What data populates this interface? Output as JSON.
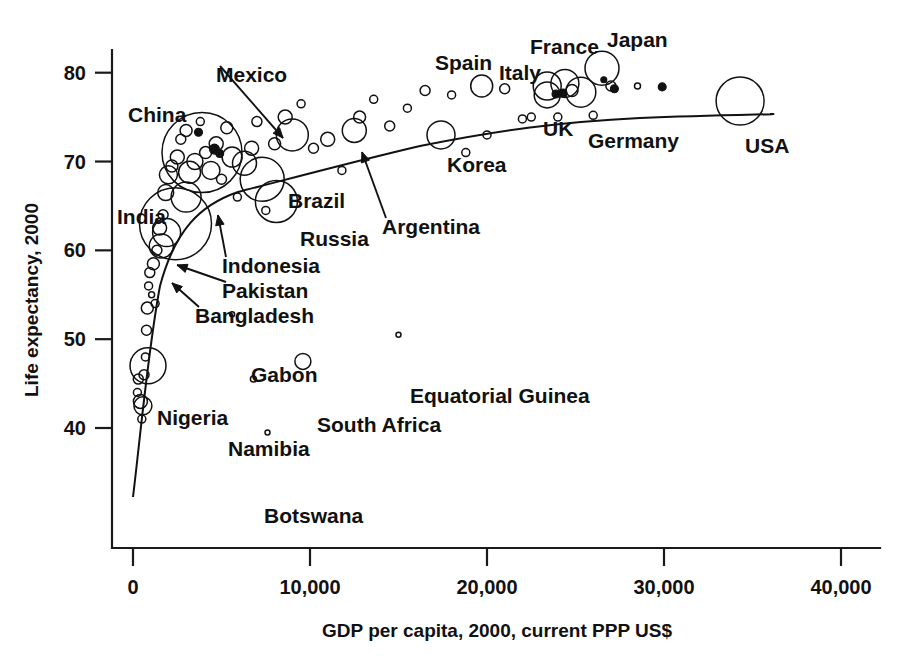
{
  "chart_data": {
    "type": "scatter",
    "title": "",
    "xlabel": "GDP per capita, 2000, current PPP US$",
    "ylabel": "Life expectancy, 2000",
    "xlim": [
      0,
      40000
    ],
    "ylim": [
      37,
      82
    ],
    "xticks": [
      0,
      10000,
      20000,
      30000,
      40000
    ],
    "xtick_labels": [
      "0",
      "10,000",
      "20,000",
      "30,000",
      "40,000"
    ],
    "yticks": [
      40,
      50,
      60,
      70,
      80
    ],
    "ytick_labels": [
      "40",
      "50",
      "60",
      "70",
      "80"
    ],
    "grid": false,
    "legend": "none",
    "marker_note": "bubble size proportional to population",
    "trend_line": true,
    "labeled_points": [
      {
        "name": "China",
        "x": 3900,
        "y": 71.0,
        "r": 40,
        "label_x": 128,
        "label_y": 122,
        "anchor": "start",
        "leader": false
      },
      {
        "name": "India",
        "x": 2400,
        "y": 63.0,
        "r": 36,
        "label_x": 117,
        "label_y": 224,
        "anchor": "start",
        "leader": false
      },
      {
        "name": "Indonesia",
        "x": 3000,
        "y": 66.0,
        "r": 15,
        "label_x": 222,
        "label_y": 273,
        "anchor": "start",
        "leader": true,
        "tip_x": 218,
        "tip_y": 215
      },
      {
        "name": "Pakistan",
        "x": 1900,
        "y": 62.0,
        "r": 14,
        "label_x": 222,
        "label_y": 298,
        "anchor": "start",
        "leader": true,
        "tip_x": 177,
        "tip_y": 265
      },
      {
        "name": "Bangladesh",
        "x": 1600,
        "y": 60.5,
        "r": 12,
        "label_x": 195,
        "label_y": 323,
        "anchor": "start",
        "leader": true,
        "tip_x": 172,
        "tip_y": 283
      },
      {
        "name": "Mexico",
        "x": 9000,
        "y": 73.0,
        "r": 16,
        "label_x": 216,
        "label_y": 82,
        "anchor": "start",
        "leader": true,
        "tip_x": 283,
        "tip_y": 138
      },
      {
        "name": "Brazil",
        "x": 7300,
        "y": 68.0,
        "r": 22,
        "label_x": 288,
        "label_y": 208,
        "anchor": "start",
        "leader": false
      },
      {
        "name": "Russia",
        "x": 8100,
        "y": 65.5,
        "r": 21,
        "label_x": 300,
        "label_y": 246,
        "anchor": "start",
        "leader": false
      },
      {
        "name": "Argentina",
        "x": 12500,
        "y": 73.5,
        "r": 12,
        "label_x": 382,
        "label_y": 234,
        "anchor": "start",
        "leader": true,
        "tip_x": 362,
        "tip_y": 152
      },
      {
        "name": "Korea",
        "x": 17400,
        "y": 73.0,
        "r": 14,
        "label_x": 447,
        "label_y": 172,
        "anchor": "start",
        "leader": false
      },
      {
        "name": "Spain",
        "x": 19700,
        "y": 78.5,
        "r": 11,
        "label_x": 435,
        "label_y": 70,
        "anchor": "start",
        "leader": false
      },
      {
        "name": "Italy",
        "x": 23400,
        "y": 78.5,
        "r": 14,
        "label_x": 499,
        "label_y": 80,
        "anchor": "start",
        "leader": false
      },
      {
        "name": "France",
        "x": 24400,
        "y": 78.8,
        "r": 14,
        "label_x": 530,
        "label_y": 54,
        "anchor": "start",
        "leader": false
      },
      {
        "name": "Japan",
        "x": 26500,
        "y": 80.5,
        "r": 17,
        "label_x": 607,
        "label_y": 47,
        "anchor": "start",
        "leader": false
      },
      {
        "name": "UK",
        "x": 23400,
        "y": 77.5,
        "r": 13,
        "label_x": 543,
        "label_y": 136,
        "anchor": "start",
        "leader": false
      },
      {
        "name": "Germany",
        "x": 25300,
        "y": 77.8,
        "r": 15,
        "label_x": 588,
        "label_y": 148,
        "anchor": "start",
        "leader": false
      },
      {
        "name": "USA",
        "x": 34300,
        "y": 76.8,
        "r": 24,
        "label_x": 745,
        "label_y": 153,
        "anchor": "start",
        "leader": false
      },
      {
        "name": "Gabon",
        "x": 5600,
        "y": 52.8,
        "r": 2.5,
        "label_x": 251,
        "label_y": 382,
        "anchor": "start",
        "leader": false
      },
      {
        "name": "Equatorial Guinea",
        "x": 15000,
        "y": 50.5,
        "r": 2.5,
        "label_x": 410,
        "label_y": 403,
        "anchor": "start",
        "leader": false
      },
      {
        "name": "South Africa",
        "x": 9600,
        "y": 47.5,
        "r": 8,
        "label_x": 317,
        "label_y": 432,
        "anchor": "start",
        "leader": false
      },
      {
        "name": "Nigeria",
        "x": 850,
        "y": 47.0,
        "r": 18,
        "label_x": 157,
        "label_y": 425,
        "anchor": "start",
        "leader": false
      },
      {
        "name": "Namibia",
        "x": 6800,
        "y": 45.5,
        "r": 3,
        "label_x": 228,
        "label_y": 456,
        "anchor": "start",
        "leader": false
      },
      {
        "name": "Botswana",
        "x": 7600,
        "y": 39.5,
        "r": 2.5,
        "label_x": 264,
        "label_y": 523,
        "anchor": "start",
        "leader": false
      }
    ],
    "unlabeled_points": [
      {
        "x": 250,
        "y": 44.0,
        "r": 4
      },
      {
        "x": 300,
        "y": 45.5,
        "r": 5
      },
      {
        "x": 420,
        "y": 43.0,
        "r": 7
      },
      {
        "x": 500,
        "y": 41.0,
        "r": 4
      },
      {
        "x": 560,
        "y": 42.5,
        "r": 9
      },
      {
        "x": 620,
        "y": 46.0,
        "r": 5
      },
      {
        "x": 700,
        "y": 48.0,
        "r": 4
      },
      {
        "x": 760,
        "y": 51.0,
        "r": 5
      },
      {
        "x": 810,
        "y": 53.5,
        "r": 6
      },
      {
        "x": 880,
        "y": 56.0,
        "r": 4
      },
      {
        "x": 950,
        "y": 57.5,
        "r": 5
      },
      {
        "x": 1050,
        "y": 55.0,
        "r": 3
      },
      {
        "x": 1150,
        "y": 58.5,
        "r": 6
      },
      {
        "x": 1250,
        "y": 54.0,
        "r": 4
      },
      {
        "x": 1350,
        "y": 60.0,
        "r": 5
      },
      {
        "x": 1500,
        "y": 62.5,
        "r": 7
      },
      {
        "x": 1700,
        "y": 64.0,
        "r": 5
      },
      {
        "x": 1850,
        "y": 66.5,
        "r": 8
      },
      {
        "x": 2000,
        "y": 68.5,
        "r": 9
      },
      {
        "x": 2200,
        "y": 69.5,
        "r": 6
      },
      {
        "x": 2500,
        "y": 70.5,
        "r": 7
      },
      {
        "x": 2700,
        "y": 72.5,
        "r": 5
      },
      {
        "x": 3000,
        "y": 73.5,
        "r": 6
      },
      {
        "x": 3200,
        "y": 68.8,
        "r": 11
      },
      {
        "x": 3500,
        "y": 70.0,
        "r": 8
      },
      {
        "x": 3800,
        "y": 74.5,
        "r": 4
      },
      {
        "x": 4100,
        "y": 71.0,
        "r": 6
      },
      {
        "x": 4400,
        "y": 69.0,
        "r": 9
      },
      {
        "x": 4700,
        "y": 72.0,
        "r": 7
      },
      {
        "x": 5000,
        "y": 68.0,
        "r": 5
      },
      {
        "x": 5300,
        "y": 73.8,
        "r": 6
      },
      {
        "x": 5600,
        "y": 70.5,
        "r": 10
      },
      {
        "x": 5900,
        "y": 66.0,
        "r": 4
      },
      {
        "x": 6300,
        "y": 69.8,
        "r": 12
      },
      {
        "x": 6700,
        "y": 71.5,
        "r": 7
      },
      {
        "x": 7000,
        "y": 74.5,
        "r": 5
      },
      {
        "x": 7500,
        "y": 64.5,
        "r": 4
      },
      {
        "x": 8000,
        "y": 72.0,
        "r": 6
      },
      {
        "x": 8600,
        "y": 75.0,
        "r": 7
      },
      {
        "x": 9500,
        "y": 76.5,
        "r": 4
      },
      {
        "x": 10200,
        "y": 71.5,
        "r": 5
      },
      {
        "x": 11000,
        "y": 72.5,
        "r": 7
      },
      {
        "x": 11800,
        "y": 69.0,
        "r": 4
      },
      {
        "x": 12800,
        "y": 75.0,
        "r": 6
      },
      {
        "x": 13600,
        "y": 77.0,
        "r": 4
      },
      {
        "x": 14500,
        "y": 74.0,
        "r": 5
      },
      {
        "x": 15500,
        "y": 76.0,
        "r": 4
      },
      {
        "x": 16500,
        "y": 78.0,
        "r": 5
      },
      {
        "x": 18000,
        "y": 77.5,
        "r": 4
      },
      {
        "x": 18800,
        "y": 71.0,
        "r": 4
      },
      {
        "x": 21000,
        "y": 78.2,
        "r": 5
      },
      {
        "x": 22000,
        "y": 74.8,
        "r": 4
      },
      {
        "x": 24800,
        "y": 78.0,
        "r": 6
      },
      {
        "x": 27000,
        "y": 78.5,
        "r": 5
      },
      {
        "x": 28500,
        "y": 78.5,
        "r": 3
      },
      {
        "x": 22500,
        "y": 75.0,
        "r": 4
      },
      {
        "x": 26000,
        "y": 75.2,
        "r": 4
      },
      {
        "x": 24000,
        "y": 75.0,
        "r": 4
      },
      {
        "x": 20000,
        "y": 73.0,
        "r": 4
      }
    ],
    "filled_points": [
      {
        "x": 23900,
        "y": 77.6,
        "r": 4
      },
      {
        "x": 24300,
        "y": 77.7,
        "r": 4
      },
      {
        "x": 27200,
        "y": 78.2,
        "r": 4
      },
      {
        "x": 26600,
        "y": 79.2,
        "r": 3
      },
      {
        "x": 29900,
        "y": 78.4,
        "r": 4
      },
      {
        "x": 3700,
        "y": 73.3,
        "r": 4
      },
      {
        "x": 4600,
        "y": 71.4,
        "r": 5
      },
      {
        "x": 4900,
        "y": 70.9,
        "r": 4
      }
    ]
  },
  "axis": {
    "xlabel": "GDP per capita, 2000, current PPP US$",
    "ylabel": "Life expectancy, 2000"
  }
}
